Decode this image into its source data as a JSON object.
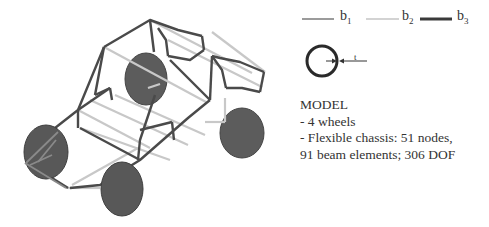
{
  "figure": {
    "type": "vehicle-chassis-beam-model",
    "legend": {
      "items": [
        {
          "symbol": "b",
          "subscript": "1",
          "line_color": "#7a7a7a",
          "line_width": 1.5
        },
        {
          "symbol": "b",
          "subscript": "2",
          "line_color": "#c4c4c4",
          "line_width": 1.5
        },
        {
          "symbol": "b",
          "subscript": "3",
          "line_color": "#3a3a3a",
          "line_width": 3
        }
      ]
    },
    "cross_section": {
      "shape": "circular-tube",
      "thickness_label": "t"
    },
    "model": {
      "title": "MODEL",
      "lines": [
        "- 4 wheels",
        "- Flexible chassis: 51 nodes,",
        "91 beam elements; 306 DOF"
      ]
    },
    "colors": {
      "dark_beam": "#4a4a4a",
      "light_beam": "#c8c8c8",
      "wheel": "#5a5a5a",
      "wheel_edge": "#3e3e3e"
    }
  }
}
